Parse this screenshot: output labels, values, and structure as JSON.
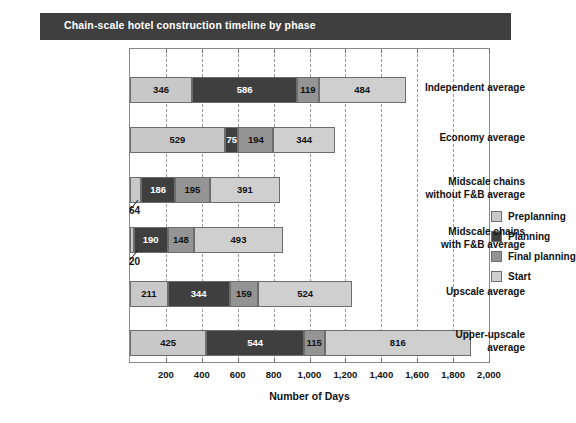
{
  "title": "Chain-scale hotel construction timeline by phase",
  "colors": {
    "preplanning": "#c8c8c8",
    "planning": "#3f3f3f",
    "final_planning": "#949494",
    "start": "#cfcfcf",
    "banner": "#3f3f3f",
    "banner_text": "#ffffff",
    "frame": "#8a8a8a",
    "grid": "#9a9a9a",
    "text": "#111111"
  },
  "legend": {
    "position": "inside-right",
    "items": [
      {
        "label": "Preplanning",
        "swatch": "#c8c8c8"
      },
      {
        "label": "Planning",
        "swatch": "#3f3f3f"
      },
      {
        "label": "Final planning",
        "swatch": "#949494"
      },
      {
        "label": "Start",
        "swatch": "#cfcfcf"
      }
    ]
  },
  "xaxis": {
    "title": "Number of Days",
    "ticks": [
      "200",
      "400",
      "600",
      "800",
      "1,000",
      "1,200",
      "1,400",
      "1,600",
      "1,800",
      "2,000"
    ],
    "min": 0,
    "max": 2000,
    "step": 200
  },
  "chart_data": {
    "type": "bar",
    "orientation": "horizontal",
    "stacked": true,
    "title": "Chain-scale hotel construction timeline by phase",
    "xlabel": "Number of Days",
    "ylabel": "",
    "xlim": [
      0,
      2000
    ],
    "grid": true,
    "legend_position": "inside-right",
    "categories": [
      "Independent average",
      "Economy average",
      "Midscale chains without F&B average",
      "Midscale chains with F&B average",
      "Upscale average",
      "Upper-upscale average"
    ],
    "series": [
      {
        "name": "Preplanning",
        "values": [
          346,
          529,
          64,
          20,
          211,
          425
        ]
      },
      {
        "name": "Planning",
        "values": [
          586,
          75,
          186,
          190,
          344,
          544
        ]
      },
      {
        "name": "Final planning",
        "values": [
          119,
          194,
          195,
          148,
          159,
          115
        ]
      },
      {
        "name": "Start",
        "values": [
          484,
          344,
          391,
          493,
          524,
          816
        ]
      }
    ],
    "totals": [
      1535,
      1142,
      836,
      851,
      1238,
      1900
    ],
    "callouts": [
      {
        "category": "Midscale chains without F&B average",
        "series": "Preplanning",
        "value": 64
      },
      {
        "category": "Midscale chains with F&B average",
        "series": "Preplanning",
        "value": 20
      }
    ]
  },
  "rows": [
    {
      "label_lines": [
        "Independent average"
      ],
      "segments": [
        {
          "name": "Preplanning",
          "value": "346",
          "inline": true
        },
        {
          "name": "Planning",
          "value": "586",
          "inline": true
        },
        {
          "name": "Final planning",
          "value": "119",
          "inline": true
        },
        {
          "name": "Start",
          "value": "484",
          "inline": true
        }
      ]
    },
    {
      "label_lines": [
        "Economy average"
      ],
      "segments": [
        {
          "name": "Preplanning",
          "value": "529",
          "inline": true
        },
        {
          "name": "Planning",
          "value": "75",
          "inline": true
        },
        {
          "name": "Final planning",
          "value": "194",
          "inline": true
        },
        {
          "name": "Start",
          "value": "344",
          "inline": true
        }
      ]
    },
    {
      "label_lines": [
        "Midscale chains",
        "without F&B average"
      ],
      "segments": [
        {
          "name": "Preplanning",
          "value": "64",
          "inline": false
        },
        {
          "name": "Planning",
          "value": "186",
          "inline": true
        },
        {
          "name": "Final planning",
          "value": "195",
          "inline": true
        },
        {
          "name": "Start",
          "value": "391",
          "inline": true
        }
      ]
    },
    {
      "label_lines": [
        "Midscale chains",
        "with F&B average"
      ],
      "segments": [
        {
          "name": "Preplanning",
          "value": "20",
          "inline": false
        },
        {
          "name": "Planning",
          "value": "190",
          "inline": true
        },
        {
          "name": "Final planning",
          "value": "148",
          "inline": true
        },
        {
          "name": "Start",
          "value": "493",
          "inline": true
        }
      ]
    },
    {
      "label_lines": [
        "Upscale average"
      ],
      "segments": [
        {
          "name": "Preplanning",
          "value": "211",
          "inline": true
        },
        {
          "name": "Planning",
          "value": "344",
          "inline": true
        },
        {
          "name": "Final planning",
          "value": "159",
          "inline": true
        },
        {
          "name": "Start",
          "value": "524",
          "inline": true
        }
      ]
    },
    {
      "label_lines": [
        "Upper-upscale",
        "average"
      ],
      "segments": [
        {
          "name": "Preplanning",
          "value": "425",
          "inline": true
        },
        {
          "name": "Planning",
          "value": "544",
          "inline": true
        },
        {
          "name": "Final planning",
          "value": "115",
          "inline": true
        },
        {
          "name": "Start",
          "value": "816",
          "inline": true
        }
      ]
    }
  ]
}
